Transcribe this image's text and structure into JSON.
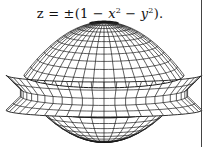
{
  "caption": {
    "equation_prefix": "z = ±(1 − ",
    "var_x": "x",
    "exp_x": "2",
    "minus": " − ",
    "var_y": "y",
    "exp_y": "2",
    "suffix": ")."
  },
  "figure": {
    "type": "wireframe-surface",
    "stroke_color": "#1a1a1a",
    "background": "#ffffff",
    "center_x": 104,
    "dome": {
      "top_y": 22,
      "base_y": 75,
      "half_width": 80,
      "lat_lines": 12,
      "lon_lines": 22
    },
    "collar": {
      "top_y": 75,
      "mid_y": 92,
      "bottom_y": 110,
      "outer_half_width": 98,
      "inner_half_width": 80,
      "rows": 5,
      "cols": 24
    },
    "bowl": {
      "top_y": 110,
      "bottom_y": 142,
      "half_width": 64,
      "lat_lines": 9,
      "lon_lines": 16
    }
  },
  "right_rule": {
    "x": 201,
    "top": 0,
    "bottom": 147,
    "color": "#444444"
  }
}
